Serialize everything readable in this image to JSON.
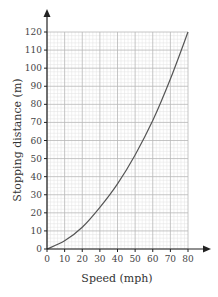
{
  "chart_data": {
    "type": "line",
    "title": "",
    "xlabel": "Speed (mph)",
    "ylabel": "Stopping distance (m)",
    "xlim": [
      0,
      80
    ],
    "ylim": [
      0,
      120
    ],
    "x_ticks": [
      0,
      10,
      20,
      30,
      40,
      50,
      60,
      70,
      80
    ],
    "y_ticks": [
      0,
      10,
      20,
      30,
      40,
      50,
      60,
      70,
      80,
      90,
      100,
      110,
      120
    ],
    "grid": true,
    "grid_minor_steps": {
      "x": 2,
      "y": 2
    },
    "legend": null,
    "series": [
      {
        "name": "Stopping distance",
        "color": "#555555",
        "x": [
          0,
          10,
          20,
          30,
          40,
          50,
          60,
          70,
          80
        ],
        "y": [
          0,
          4.5,
          12,
          23,
          36,
          52,
          71,
          94,
          120
        ]
      }
    ]
  },
  "colors": {
    "major_grid": "#b8b8b8",
    "minor_grid": "#e2e2e2",
    "axis": "#222222",
    "curve": "#555555"
  }
}
